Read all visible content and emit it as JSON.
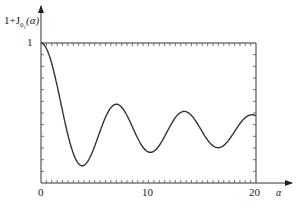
{
  "chart_data": {
    "type": "line",
    "title": "",
    "ylabel": "1+J0(α)",
    "xlabel": "α",
    "x_ticks": [
      "0",
      "10",
      "20"
    ],
    "y_ticks": [
      "1"
    ],
    "xlim": [
      0,
      20
    ],
    "grid": false,
    "legend": null,
    "series": [
      {
        "name": "1+J0(α) (normalized)",
        "x": [
          0,
          2,
          3.83,
          5,
          7.02,
          8.5,
          10.17,
          12,
          13.32,
          15,
          16.47,
          18,
          20
        ],
        "values": [
          1.0,
          0.69,
          0.12,
          0.3,
          0.56,
          0.37,
          0.19,
          0.4,
          0.5,
          0.39,
          0.27,
          0.37,
          0.43
        ]
      }
    ]
  },
  "labels": {
    "ylabel_main": "1+J",
    "ylabel_sub": "0",
    "ylabel_sub2": "1",
    "ylabel_arg": "(α)",
    "y_one": "1",
    "x0": "0",
    "x10": "10",
    "x20": "20",
    "xvar": "α"
  }
}
